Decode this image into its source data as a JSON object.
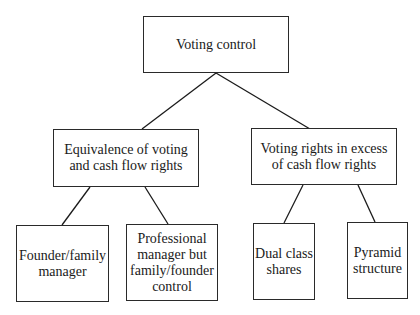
{
  "diagram": {
    "root": {
      "label": "Voting control"
    },
    "level2": [
      {
        "label": "Equivalence of voting\nand cash flow rights"
      },
      {
        "label": "Voting rights in excess\nof cash flow rights"
      }
    ],
    "level3": [
      {
        "label": "Founder/family\nmanager",
        "parent": 0
      },
      {
        "label": "Professional\nmanager but\nfamily/founder\ncontrol",
        "parent": 0
      },
      {
        "label": "Dual class\nshares",
        "parent": 1
      },
      {
        "label": "Pyramid\nstructure",
        "parent": 1
      }
    ]
  }
}
